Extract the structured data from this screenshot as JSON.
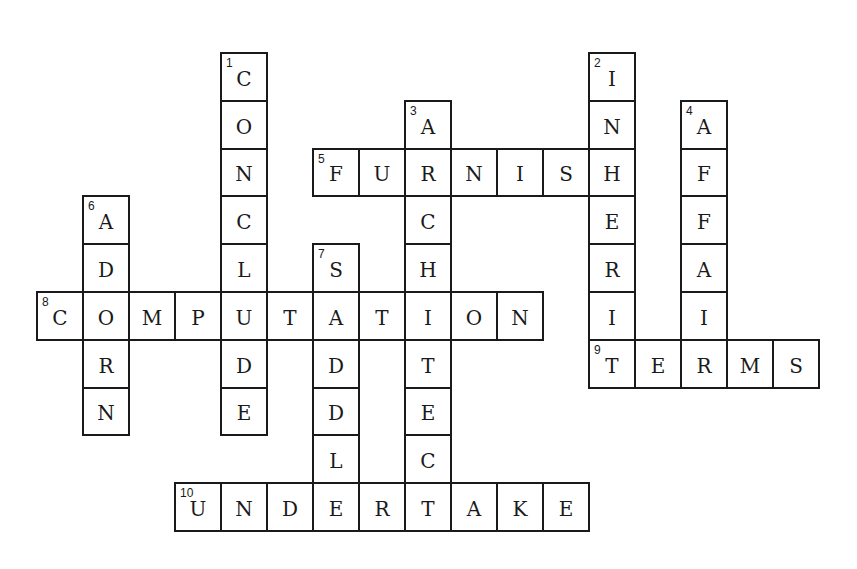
{
  "puzzle": {
    "type": "crossword",
    "grid": {
      "origin_x": 36,
      "origin_y": 52,
      "cell_w": 46,
      "cell_h": 47.8
    },
    "words": [
      {
        "number": 1,
        "direction": "down",
        "answer": "CONCLUDE",
        "row": 0,
        "col": 4
      },
      {
        "number": 2,
        "direction": "down",
        "answer": "INHERIT",
        "row": 0,
        "col": 12
      },
      {
        "number": 3,
        "direction": "down",
        "answer": "ARCHITECT",
        "row": 1,
        "col": 8
      },
      {
        "number": 4,
        "direction": "down",
        "answer": "AFFAIR",
        "row": 1,
        "col": 14
      },
      {
        "number": 5,
        "direction": "across",
        "answer": "FURNISH",
        "row": 2,
        "col": 6
      },
      {
        "number": 6,
        "direction": "down",
        "answer": "ADORN",
        "row": 3,
        "col": 1
      },
      {
        "number": 7,
        "direction": "down",
        "answer": "SADDLE",
        "row": 4,
        "col": 6
      },
      {
        "number": 8,
        "direction": "across",
        "answer": "COMPUTATION",
        "row": 5,
        "col": 0
      },
      {
        "number": 9,
        "direction": "across",
        "answer": "TERMS",
        "row": 6,
        "col": 12
      },
      {
        "number": 10,
        "direction": "across",
        "answer": "UNDERTAKE",
        "row": 9,
        "col": 3
      }
    ],
    "colors": {
      "border": "#1a1a1a",
      "cell_bg": "#ffffff",
      "text": "#1a1a1a"
    }
  }
}
